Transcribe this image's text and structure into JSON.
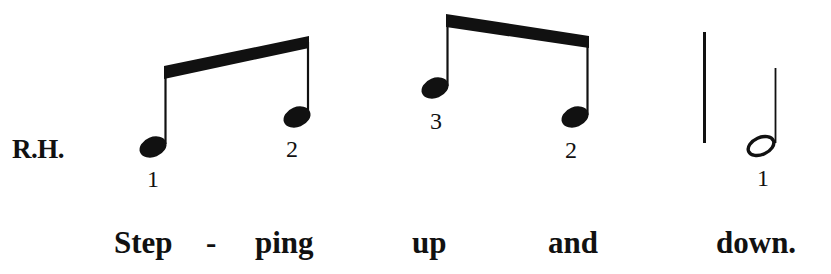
{
  "score": {
    "hand_label": "R.H.",
    "notes": [
      {
        "id": "note-1",
        "type": "eighth",
        "fingering": "1"
      },
      {
        "id": "note-2",
        "type": "eighth",
        "fingering": "2"
      },
      {
        "id": "note-3",
        "type": "eighth",
        "fingering": "3"
      },
      {
        "id": "note-4",
        "type": "eighth",
        "fingering": "2"
      },
      {
        "id": "note-5",
        "type": "half",
        "fingering": "1"
      }
    ],
    "beams": [
      {
        "id": "beam-1",
        "notes": [
          "note-1",
          "note-2"
        ],
        "direction": "ascending"
      },
      {
        "id": "beam-2",
        "notes": [
          "note-3",
          "note-4"
        ],
        "direction": "descending"
      }
    ],
    "barline": "single",
    "lyrics": [
      {
        "text": "Step"
      },
      {
        "text": "-"
      },
      {
        "text": "ping"
      },
      {
        "text": "up"
      },
      {
        "text": "and"
      },
      {
        "text": "down."
      }
    ],
    "colors": {
      "ink": "#111111",
      "paper": "#ffffff"
    }
  }
}
